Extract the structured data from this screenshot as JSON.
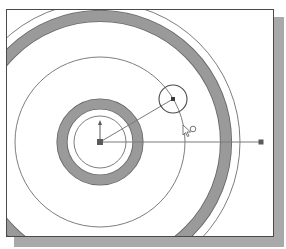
{
  "canvas": {
    "background": "#ffffff",
    "frame_border_color": "#4a4a4a",
    "shadow_color": "#a9a9a9"
  },
  "sketch": {
    "center": {
      "x": 93,
      "y": 132
    },
    "colors": {
      "thin_line": "#6e6e6e",
      "ring_fill": "#9a9a9a",
      "ring_edge": "#6a6a6a",
      "construction_line": "#7a7a7a",
      "point": "#5a5a5a"
    },
    "circles": [
      {
        "name": "inner-thin-circle",
        "r": 26
      },
      {
        "name": "mid-thin-circle",
        "r": 85
      },
      {
        "name": "outer-thin-circle",
        "r": 140
      }
    ],
    "rings": [
      {
        "name": "inner-thick-ring",
        "r": 38,
        "width": 10
      },
      {
        "name": "outer-thick-ring",
        "r": 126,
        "width": 11
      }
    ],
    "dragged_circle": {
      "cx": 166,
      "cy": 89,
      "r": 14
    },
    "horizontal_line_end": {
      "x": 254,
      "y": 132
    },
    "vertical_arrow_top": {
      "x": 93,
      "y": 112
    },
    "cursor": {
      "x": 176,
      "y": 115,
      "icon": "arrow-pointer-with-circle-snap-icon"
    }
  }
}
